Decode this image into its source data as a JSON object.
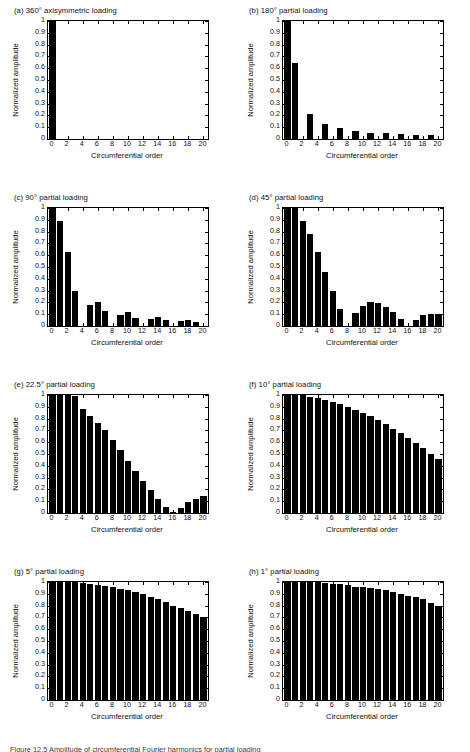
{
  "figure": {
    "width": 470,
    "height": 752,
    "caption_fragment": "Figure 12.5  Amplitude of circumferential Fourier harmonics for partial loading",
    "bar_color": "#000000",
    "axis_color": "#000000",
    "background": "#ffffff"
  },
  "axis": {
    "xlabel": "Circumferential order",
    "ylabel": "Normalized amplitude",
    "xticks": [
      0,
      2,
      4,
      6,
      8,
      10,
      12,
      14,
      16,
      18,
      20
    ],
    "xtick_labels": [
      "0",
      "2",
      "4",
      "6",
      "8",
      "10",
      "12",
      "14",
      "16",
      "18",
      "20"
    ],
    "yticks": [
      0,
      0.1,
      0.2,
      0.3,
      0.4,
      0.5,
      0.6,
      0.7,
      0.8,
      0.9,
      1
    ],
    "ytick_labels": [
      "0",
      "0.1",
      "0.2",
      "0.3",
      "0.4",
      "0.5",
      "0.6",
      "0.7",
      "0.8",
      "0.9",
      "1"
    ],
    "xlim": [
      -0.6,
      20.6
    ],
    "ylim": [
      0,
      1
    ]
  },
  "chart_data": [
    {
      "id": "a",
      "type": "bar",
      "title": "(a) 360° axisymmetric loading",
      "xlabel": "Circumferential order",
      "ylabel": "Normalized amplitude",
      "xlim": [
        -0.6,
        20.6
      ],
      "ylim": [
        0,
        1
      ],
      "grid": false,
      "categories": [
        0,
        1,
        2,
        3,
        4,
        5,
        6,
        7,
        8,
        9,
        10,
        11,
        12,
        13,
        14,
        15,
        16,
        17,
        18,
        19,
        20
      ],
      "values": [
        1,
        0,
        0,
        0,
        0,
        0,
        0,
        0,
        0,
        0,
        0,
        0,
        0,
        0,
        0,
        0,
        0,
        0,
        0,
        0,
        0
      ]
    },
    {
      "id": "b",
      "type": "bar",
      "title": "(b) 180° partial loading",
      "xlabel": "Circumferential order",
      "ylabel": "Normalized amplitude",
      "xlim": [
        -0.6,
        20.6
      ],
      "ylim": [
        0,
        1
      ],
      "grid": false,
      "categories": [
        0,
        1,
        2,
        3,
        4,
        5,
        6,
        7,
        8,
        9,
        10,
        11,
        12,
        13,
        14,
        15,
        16,
        17,
        18,
        19,
        20
      ],
      "values": [
        1,
        0.64,
        0,
        0.21,
        0,
        0.125,
        0,
        0.09,
        0,
        0.07,
        0,
        0.055,
        0,
        0.048,
        0,
        0.042,
        0,
        0.037,
        0,
        0.031,
        0
      ]
    },
    {
      "id": "c",
      "type": "bar",
      "title": "(c) 90° partial loading",
      "xlabel": "Circumferential order",
      "ylabel": "Normalized amplitude",
      "xlim": [
        -0.6,
        20.6
      ],
      "ylim": [
        0,
        1
      ],
      "grid": false,
      "categories": [
        0,
        1,
        2,
        3,
        4,
        5,
        6,
        7,
        8,
        9,
        10,
        11,
        12,
        13,
        14,
        15,
        16,
        17,
        18,
        19,
        20
      ],
      "values": [
        1,
        0.89,
        0.63,
        0.3,
        0,
        0.175,
        0.205,
        0.125,
        0,
        0.097,
        0.115,
        0.072,
        0,
        0.062,
        0.077,
        0.05,
        0,
        0.045,
        0.055,
        0.038,
        0
      ]
    },
    {
      "id": "d",
      "type": "bar",
      "title": "(d) 45° partial loading",
      "xlabel": "Circumferential order",
      "ylabel": "Normalized amplitude",
      "xlim": [
        -0.6,
        20.6
      ],
      "ylim": [
        0,
        1
      ],
      "grid": false,
      "categories": [
        0,
        1,
        2,
        3,
        4,
        5,
        6,
        7,
        8,
        9,
        10,
        11,
        12,
        13,
        14,
        15,
        16,
        17,
        18,
        19,
        20
      ],
      "values": [
        1,
        1,
        0.89,
        0.78,
        0.63,
        0.46,
        0.3,
        0.14,
        0,
        0.11,
        0.17,
        0.2,
        0.195,
        0.16,
        0.115,
        0.06,
        0,
        0.055,
        0.09,
        0.105,
        0.105
      ]
    },
    {
      "id": "e",
      "type": "bar",
      "title": "(e) 22.5° partial loading",
      "xlabel": "Circumferential order",
      "ylabel": "Normalized amplitude",
      "xlim": [
        -0.6,
        20.6
      ],
      "ylim": [
        0,
        1
      ],
      "grid": false,
      "categories": [
        0,
        1,
        2,
        3,
        4,
        5,
        6,
        7,
        8,
        9,
        10,
        11,
        12,
        13,
        14,
        15,
        16,
        17,
        18,
        19,
        20
      ],
      "values": [
        1,
        1,
        1,
        0.99,
        0.885,
        0.825,
        0.765,
        0.7,
        0.615,
        0.53,
        0.445,
        0.355,
        0.27,
        0.195,
        0.12,
        0.055,
        0.01,
        0.045,
        0.09,
        0.12,
        0.14
      ]
    },
    {
      "id": "f",
      "type": "bar",
      "title": "(f) 10° partial loading",
      "xlabel": "Circumferential order",
      "ylabel": "Normalized amplitude",
      "xlim": [
        -0.6,
        20.6
      ],
      "ylim": [
        0,
        1
      ],
      "grid": false,
      "categories": [
        0,
        1,
        2,
        3,
        4,
        5,
        6,
        7,
        8,
        9,
        10,
        11,
        12,
        13,
        14,
        15,
        16,
        17,
        18,
        19,
        20
      ],
      "values": [
        1,
        1,
        1,
        0.985,
        0.975,
        0.955,
        0.94,
        0.925,
        0.9,
        0.875,
        0.845,
        0.82,
        0.785,
        0.755,
        0.715,
        0.675,
        0.635,
        0.59,
        0.55,
        0.5,
        0.455
      ]
    },
    {
      "id": "g",
      "type": "bar",
      "title": "(g) 5° partial loading",
      "xlabel": "Circumferential order",
      "ylabel": "Normalized amplitude",
      "xlim": [
        -0.6,
        20.6
      ],
      "ylim": [
        0,
        1
      ],
      "grid": false,
      "categories": [
        0,
        1,
        2,
        3,
        4,
        5,
        6,
        7,
        8,
        9,
        10,
        11,
        12,
        13,
        14,
        15,
        16,
        17,
        18,
        19,
        20
      ],
      "values": [
        1,
        1,
        1,
        1,
        0.99,
        0.985,
        0.975,
        0.965,
        0.955,
        0.945,
        0.93,
        0.915,
        0.895,
        0.875,
        0.855,
        0.83,
        0.8,
        0.78,
        0.755,
        0.725,
        0.7
      ]
    },
    {
      "id": "h",
      "type": "bar",
      "title": "(h) 1° partial loading",
      "xlabel": "Circumferential order",
      "ylabel": "Normalized amplitude",
      "xlim": [
        -0.6,
        20.6
      ],
      "ylim": [
        0,
        1
      ],
      "grid": false,
      "categories": [
        0,
        1,
        2,
        3,
        4,
        5,
        6,
        7,
        8,
        9,
        10,
        11,
        12,
        13,
        14,
        15,
        16,
        17,
        18,
        19,
        20
      ],
      "values": [
        1,
        1,
        1,
        1,
        1,
        0.99,
        0.985,
        0.98,
        0.975,
        0.96,
        0.955,
        0.95,
        0.94,
        0.93,
        0.915,
        0.9,
        0.885,
        0.87,
        0.855,
        0.825,
        0.8
      ]
    }
  ]
}
